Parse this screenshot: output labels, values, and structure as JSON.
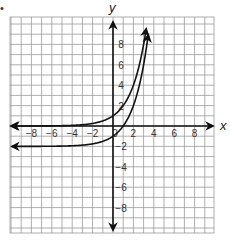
{
  "bullet": "•",
  "chart_data": {
    "type": "line",
    "title": "",
    "xlabel": "x",
    "ylabel": "y",
    "xlim": [
      -10,
      10
    ],
    "ylim": [
      -10,
      10
    ],
    "grid": true,
    "x_ticks": [
      "-8",
      "-6",
      "-4",
      "-2",
      "0",
      "2",
      "4",
      "6",
      "8"
    ],
    "y_ticks": [
      "8",
      "6",
      "4",
      "2",
      "-2",
      "-4",
      "-6",
      "-8"
    ],
    "series": [
      {
        "name": "upper curve",
        "asymptote": 0,
        "y_intercept": 1,
        "points": [
          [
            -10,
            0.001
          ],
          [
            -4,
            0.06
          ],
          [
            -2,
            0.25
          ],
          [
            -1,
            0.5
          ],
          [
            0,
            1
          ],
          [
            1,
            2
          ],
          [
            2,
            4
          ],
          [
            3,
            8
          ],
          [
            3.3,
            9.8
          ]
        ]
      },
      {
        "name": "lower curve",
        "asymptote": -2,
        "y_intercept": -1,
        "points": [
          [
            -10,
            -1.999
          ],
          [
            -4,
            -1.94
          ],
          [
            -2,
            -1.75
          ],
          [
            -1,
            -1.5
          ],
          [
            0,
            -1
          ],
          [
            1,
            0
          ],
          [
            2,
            2
          ],
          [
            3,
            6
          ],
          [
            3.5,
            9.3
          ]
        ]
      }
    ]
  }
}
